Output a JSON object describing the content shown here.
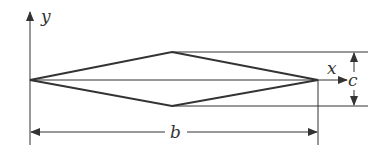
{
  "diagram": {
    "type": "rhombus-cross-section",
    "labels": {
      "y_axis": "y",
      "x_axis": "x",
      "height_dim": "c",
      "width_dim": "b"
    },
    "colors": {
      "stroke": "#333333",
      "background": "#ffffff"
    }
  }
}
